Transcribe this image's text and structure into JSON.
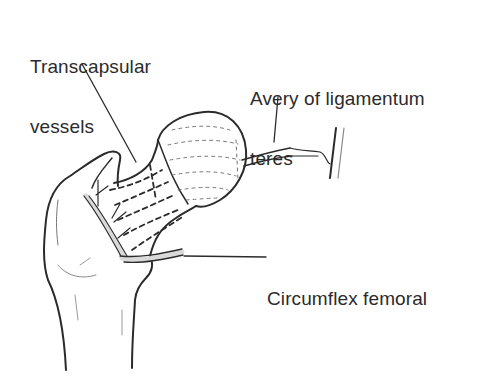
{
  "figure": {
    "labels": {
      "transcapsular_line1": "Transcapsular",
      "transcapsular_line2": "vessels",
      "avery_line1": "Avery of ligamentum",
      "avery_line2": "teres",
      "circumflex": "Circumflex femoral"
    },
    "colors": {
      "ink": "#2b2b2b",
      "vessel_fill": "#d9d9d9",
      "background": "#ffffff"
    }
  }
}
